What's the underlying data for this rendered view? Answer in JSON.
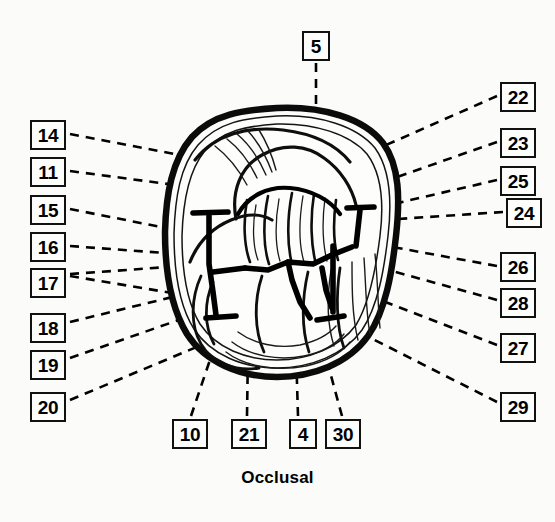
{
  "figure": {
    "caption": "Occlusal",
    "view_name": "Occlusal",
    "colors": {
      "background": "#fbfbfa",
      "ink": "#000000",
      "outline": "#111111",
      "box_border": "#111111",
      "box_fill": "#fdfdfc"
    },
    "leader_line_style": "dashed",
    "callouts": [
      {
        "id": "c5",
        "label": "5",
        "x": 302,
        "y": 31,
        "side": "top",
        "digits": 1,
        "leader": [
          [
            316,
            63
          ],
          [
            316,
            80
          ],
          [
            316,
            100
          ],
          [
            316,
            120
          ],
          [
            316,
            140
          ]
        ]
      },
      {
        "id": "c14",
        "label": "14",
        "x": 30,
        "y": 120,
        "side": "left",
        "digits": 2,
        "leader": [
          [
            70,
            134
          ],
          [
            200,
            158
          ],
          [
            300,
            178
          ]
        ]
      },
      {
        "id": "c11",
        "label": "11",
        "x": 30,
        "y": 157,
        "side": "left",
        "digits": 2,
        "leader": [
          [
            70,
            171
          ],
          [
            200,
            186
          ],
          [
            296,
            200
          ]
        ]
      },
      {
        "id": "c15",
        "label": "15",
        "x": 30,
        "y": 195,
        "side": "left",
        "digits": 2,
        "leader": [
          [
            70,
            209
          ],
          [
            180,
            230
          ],
          [
            250,
            244
          ]
        ]
      },
      {
        "id": "c16",
        "label": "16",
        "x": 30,
        "y": 232,
        "side": "left",
        "digits": 2,
        "leader": [
          [
            70,
            246
          ],
          [
            180,
            252
          ],
          [
            245,
            258
          ]
        ]
      },
      {
        "id": "c17",
        "label": "17",
        "x": 30,
        "y": 268,
        "side": "left",
        "digits": 2,
        "leader": [
          [
            70,
            274
          ],
          [
            160,
            266
          ],
          [
            236,
            262
          ]
        ]
      },
      {
        "id": "c18",
        "label": "18",
        "x": 30,
        "y": 313,
        "side": "left",
        "digits": 2,
        "leader": [
          [
            70,
            322
          ],
          [
            160,
            300
          ],
          [
            232,
            282
          ]
        ]
      },
      {
        "id": "c19",
        "label": "19",
        "x": 30,
        "y": 350,
        "side": "left",
        "digits": 2,
        "leader": [
          [
            70,
            358
          ],
          [
            160,
            330
          ],
          [
            234,
            300
          ]
        ]
      },
      {
        "id": "c20",
        "label": "20",
        "x": 30,
        "y": 392,
        "side": "left",
        "digits": 2,
        "leader": [
          [
            70,
            400
          ],
          [
            170,
            360
          ],
          [
            240,
            328
          ]
        ]
      },
      {
        "id": "c22",
        "label": "22",
        "x": 500,
        "y": 82,
        "side": "right",
        "digits": 2,
        "leader": [
          [
            497,
            96
          ],
          [
            420,
            125
          ],
          [
            350,
            160
          ]
        ]
      },
      {
        "id": "c23",
        "label": "23",
        "x": 500,
        "y": 128,
        "side": "right",
        "digits": 2,
        "leader": [
          [
            497,
            142
          ],
          [
            420,
            170
          ],
          [
            340,
            196
          ]
        ]
      },
      {
        "id": "c25",
        "label": "25",
        "x": 500,
        "y": 166,
        "side": "right",
        "digits": 2,
        "leader": [
          [
            497,
            180
          ],
          [
            420,
            198
          ],
          [
            345,
            214
          ]
        ]
      },
      {
        "id": "c24",
        "label": "24",
        "x": 506,
        "y": 198,
        "side": "right",
        "digits": 2,
        "leader": [
          [
            503,
            212
          ],
          [
            420,
            216
          ],
          [
            338,
            222
          ]
        ]
      },
      {
        "id": "c26",
        "label": "26",
        "x": 500,
        "y": 252,
        "side": "right",
        "digits": 2,
        "leader": [
          [
            497,
            266
          ],
          [
            420,
            252
          ],
          [
            342,
            238
          ]
        ]
      },
      {
        "id": "c28",
        "label": "28",
        "x": 500,
        "y": 288,
        "side": "right",
        "digits": 2,
        "leader": [
          [
            497,
            300
          ],
          [
            420,
            280
          ],
          [
            344,
            258
          ]
        ]
      },
      {
        "id": "c27",
        "label": "27",
        "x": 500,
        "y": 333,
        "side": "right",
        "digits": 2,
        "leader": [
          [
            497,
            345
          ],
          [
            420,
            318
          ],
          [
            348,
            288
          ]
        ]
      },
      {
        "id": "c29",
        "label": "29",
        "x": 500,
        "y": 392,
        "side": "right",
        "digits": 2,
        "leader": [
          [
            497,
            402
          ],
          [
            420,
            368
          ],
          [
            356,
            330
          ]
        ]
      },
      {
        "id": "c10",
        "label": "10",
        "x": 172,
        "y": 419,
        "side": "bottom",
        "digits": 2,
        "leader": [
          [
            191,
            416
          ],
          [
            200,
            390
          ],
          [
            212,
            352
          ]
        ]
      },
      {
        "id": "c21",
        "label": "21",
        "x": 231,
        "y": 419,
        "side": "bottom",
        "digits": 2,
        "leader": [
          [
            247,
            416
          ],
          [
            247,
            390
          ],
          [
            248,
            352
          ]
        ]
      },
      {
        "id": "c4",
        "label": "4",
        "x": 285,
        "y": 419,
        "side": "bottom",
        "digits": 1,
        "leader": [
          [
            298,
            416
          ],
          [
            298,
            390
          ],
          [
            296,
            352
          ]
        ]
      },
      {
        "id": "c30",
        "label": "30",
        "x": 325,
        "y": 419,
        "side": "bottom",
        "digits": 2,
        "leader": [
          [
            342,
            416
          ],
          [
            334,
            390
          ],
          [
            324,
            352
          ]
        ]
      }
    ]
  }
}
